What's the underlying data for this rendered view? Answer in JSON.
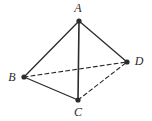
{
  "figure": {
    "type": "geometry-diagram",
    "shape_name": "tetrahedron",
    "width": 152,
    "height": 121,
    "background_color": "#ffffff",
    "ink_color": "#2b2b2b",
    "vertices": [
      {
        "id": "A",
        "label": "A",
        "x": 79,
        "y": 21,
        "label_x": 78,
        "label_y": 8,
        "dot_radius": 2.6
      },
      {
        "id": "B",
        "label": "B",
        "x": 24,
        "y": 77,
        "label_x": 12,
        "label_y": 77,
        "dot_radius": 2.6
      },
      {
        "id": "C",
        "label": "C",
        "x": 78,
        "y": 100,
        "label_x": 78,
        "label_y": 112,
        "dot_radius": 2.6
      },
      {
        "id": "D",
        "label": "D",
        "x": 127,
        "y": 62,
        "label_x": 139,
        "label_y": 61,
        "dot_radius": 2.6
      }
    ],
    "edges": [
      {
        "id": "AB",
        "from": "A",
        "to": "B",
        "style": "solid",
        "width": 1.3
      },
      {
        "id": "AC",
        "from": "A",
        "to": "C",
        "style": "solid",
        "width": 1.6
      },
      {
        "id": "AD",
        "from": "A",
        "to": "D",
        "style": "solid",
        "width": 1.3
      },
      {
        "id": "BC",
        "from": "B",
        "to": "C",
        "style": "solid",
        "width": 1.3
      },
      {
        "id": "BD",
        "from": "B",
        "to": "D",
        "style": "dashed",
        "width": 1.1,
        "dash": "4 3"
      },
      {
        "id": "CD",
        "from": "C",
        "to": "D",
        "style": "dashed",
        "width": 1.1,
        "dash": "4 3"
      }
    ]
  }
}
